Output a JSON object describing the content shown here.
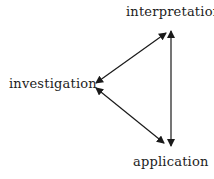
{
  "diagram": {
    "nodes": [
      {
        "id": "interpretation",
        "label": "interpretation"
      },
      {
        "id": "investigation",
        "label": "investigation"
      },
      {
        "id": "application",
        "label": "application"
      }
    ],
    "edges": [
      {
        "from": "investigation",
        "to": "interpretation",
        "type": "bidirectional-arrow"
      },
      {
        "from": "investigation",
        "to": "application",
        "type": "bidirectional-arrow"
      },
      {
        "from": "interpretation",
        "to": "application",
        "type": "bidirectional-arrow"
      }
    ],
    "colors": {
      "line": "#1a1a1a",
      "text": "#222222",
      "background": "#ffffff"
    }
  }
}
